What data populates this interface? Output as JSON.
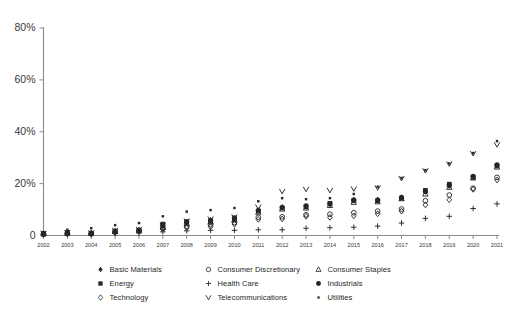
{
  "chart_data": {
    "type": "scatter",
    "title": "",
    "subtitle": "",
    "xlabel": "",
    "ylabel": "",
    "grid": false,
    "legend_position": "bottom",
    "x": [
      2002,
      2003,
      2004,
      2005,
      2006,
      2007,
      2008,
      2009,
      2010,
      2011,
      2012,
      2013,
      2014,
      2015,
      2016,
      2017,
      2018,
      2019,
      2020,
      2021
    ],
    "xlim": [
      2002,
      2021
    ],
    "ylim": [
      0,
      80
    ],
    "ytick_labels": [
      "0",
      "20%",
      "40%",
      "60%",
      "80%"
    ],
    "ytick_values": [
      0,
      20,
      40,
      60,
      80
    ],
    "xtick_labels": [
      "2002",
      "2003",
      "2004",
      "2005",
      "2006",
      "2007",
      "2008",
      "2009",
      "2010",
      "2011",
      "2012",
      "2013",
      "2014",
      "2015",
      "2016",
      "2017",
      "2018",
      "2019",
      "2020",
      "2021"
    ],
    "series": [
      {
        "name": "Basic Materials",
        "marker": "filled-diamond",
        "color": "#262626",
        "values": [
          0.8,
          1.0,
          0.8,
          1.8,
          2.2,
          3.6,
          5.0,
          6.0,
          6.6,
          9.8,
          11.0,
          11.2,
          12.0,
          13.8,
          13.8,
          14.8,
          16.8,
          19.0,
          22.6,
          27.0
        ]
      },
      {
        "name": "Energy",
        "marker": "filled-square",
        "color": "#262626",
        "values": [
          0.7,
          1.2,
          0.9,
          1.6,
          2.0,
          4.4,
          5.4,
          5.4,
          6.2,
          9.4,
          10.6,
          11.0,
          12.4,
          13.4,
          13.4,
          14.4,
          17.4,
          19.8,
          22.4,
          26.8
        ]
      },
      {
        "name": "Technology",
        "marker": "open-diamond",
        "color": "#262626",
        "values": [
          0.5,
          0.7,
          0.6,
          1.2,
          1.6,
          2.4,
          3.0,
          3.4,
          4.4,
          6.2,
          6.4,
          7.4,
          7.0,
          7.6,
          8.4,
          9.4,
          11.8,
          13.8,
          17.8,
          21.4
        ]
      },
      {
        "name": "Consumer Discretionary",
        "marker": "open-circle",
        "color": "#262626",
        "values": [
          0.5,
          0.8,
          0.7,
          1.4,
          1.8,
          2.8,
          3.6,
          4.2,
          5.0,
          7.0,
          7.2,
          8.0,
          8.2,
          8.8,
          9.4,
          10.2,
          13.4,
          15.6,
          18.2,
          22.4
        ]
      },
      {
        "name": "Health Care",
        "marker": "plus",
        "color": "#262626",
        "values": [
          0.4,
          0.5,
          0.4,
          0.8,
          1.0,
          1.4,
          1.8,
          2.0,
          2.0,
          2.2,
          2.2,
          2.8,
          3.0,
          3.2,
          3.6,
          4.8,
          6.6,
          7.4,
          10.4,
          12.2
        ]
      },
      {
        "name": "Telecommunications",
        "marker": "vee",
        "color": "#262626",
        "values": [
          0.9,
          1.1,
          1.0,
          2.0,
          2.4,
          4.0,
          5.6,
          6.4,
          7.2,
          11.0,
          17.0,
          17.8,
          17.4,
          18.0,
          18.4,
          22.0,
          25.0,
          27.6,
          31.6,
          35.0
        ]
      },
      {
        "name": "Consumer Staples",
        "marker": "triangle",
        "color": "#262626",
        "values": [
          0.6,
          0.9,
          0.8,
          1.5,
          1.9,
          3.2,
          4.6,
          5.2,
          6.0,
          9.0,
          10.2,
          10.6,
          11.6,
          12.8,
          13.0,
          14.2,
          16.0,
          18.6,
          22.2,
          26.4
        ]
      },
      {
        "name": "Industrials",
        "marker": "filled-circle",
        "color": "#262626",
        "values": [
          0.8,
          1.0,
          0.9,
          1.7,
          2.1,
          3.8,
          5.2,
          5.8,
          6.8,
          9.6,
          10.8,
          11.4,
          12.2,
          13.6,
          13.6,
          14.6,
          17.0,
          19.4,
          22.8,
          27.2
        ]
      },
      {
        "name": "Utilities",
        "marker": "small-dot",
        "color": "#262626",
        "values": [
          1.2,
          2.2,
          2.8,
          4.0,
          4.8,
          7.4,
          9.2,
          9.8,
          10.6,
          13.2,
          14.4,
          14.0,
          14.4,
          16.0,
          18.8,
          22.2,
          25.2,
          27.8,
          31.8,
          36.4
        ]
      }
    ]
  },
  "axis": {
    "y_labels": [
      "80%",
      "60%",
      "40%",
      "20%",
      "0"
    ],
    "x_labels": [
      "2002",
      "2003",
      "2004",
      "2005",
      "2006",
      "2007",
      "2008",
      "2009",
      "2010",
      "2011",
      "2012",
      "2013",
      "2014",
      "2015",
      "2016",
      "2017",
      "2018",
      "2019",
      "2020",
      "2021"
    ]
  },
  "legend": {
    "items": [
      {
        "label": "Basic Materials",
        "marker": "filled-diamond"
      },
      {
        "label": "Consumer Discretionary",
        "marker": "open-circle"
      },
      {
        "label": "Consumer Staples",
        "marker": "triangle"
      },
      {
        "label": "Energy",
        "marker": "filled-square"
      },
      {
        "label": "Health Care",
        "marker": "plus"
      },
      {
        "label": "Industrials",
        "marker": "filled-circle"
      },
      {
        "label": "Technology",
        "marker": "open-diamond"
      },
      {
        "label": "Telecommunications",
        "marker": "vee"
      },
      {
        "label": "Utilities",
        "marker": "small-dot"
      }
    ]
  },
  "colors": {
    "marker": "#262626",
    "axis": "#8a8a8a",
    "text": "#3a3a3a",
    "background": "#ffffff"
  }
}
